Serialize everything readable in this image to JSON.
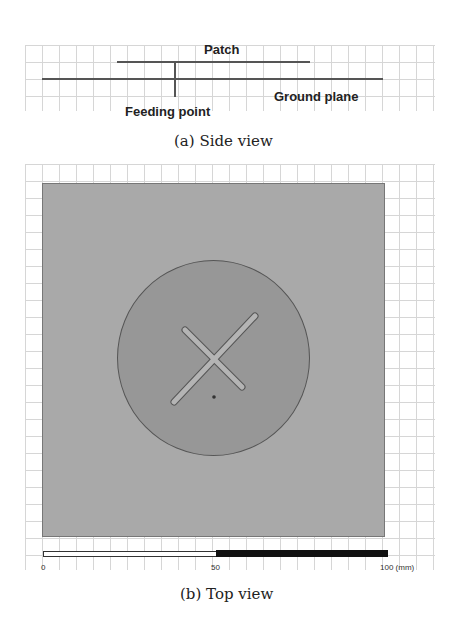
{
  "side_view": {
    "caption": "(a) Side view",
    "labels": {
      "patch": "Patch",
      "ground_plane": "Ground plane",
      "feeding_point": "Feeding point"
    }
  },
  "top_view": {
    "caption": "(b) Top view",
    "scale_bar": {
      "ticks": [
        "0",
        "50",
        "100 (mm)"
      ]
    }
  },
  "colors": {
    "ground_plane": "#a9a9a9",
    "patch": "#979797",
    "slot": "#b4b4b4",
    "line": "#555555",
    "grid": "#d6d6d6"
  }
}
